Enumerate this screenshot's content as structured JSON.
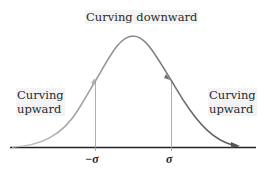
{
  "labels": {
    "top": "Curving downward",
    "left_line1": "Curving",
    "left_line2": "upward",
    "right_line1": "Curving",
    "right_line2": "upward"
  },
  "axis": {
    "tick_negative": "−σ",
    "tick_positive": "σ"
  },
  "colors": {
    "curve_start": "#bdbdbd",
    "curve_end": "#5a5a5a",
    "axis": "#222222",
    "marker_lines": "#999999"
  }
}
